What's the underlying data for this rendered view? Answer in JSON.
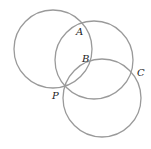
{
  "diagram": {
    "circles": [
      {
        "name": "circle-1",
        "cx": 53,
        "cy": 49,
        "r": 39
      },
      {
        "name": "circle-2",
        "cx": 94,
        "cy": 60,
        "r": 39
      },
      {
        "name": "circle-3",
        "cx": 102,
        "cy": 98,
        "r": 39
      }
    ],
    "points": {
      "A": {
        "label": "A",
        "x": 76,
        "y": 35
      },
      "B": {
        "label": "B",
        "x": 82,
        "y": 62
      },
      "C": {
        "label": "C",
        "x": 137,
        "y": 76
      },
      "P": {
        "label": "P",
        "x": 52,
        "y": 99
      }
    },
    "stroke_color": "#9a9a9a"
  }
}
